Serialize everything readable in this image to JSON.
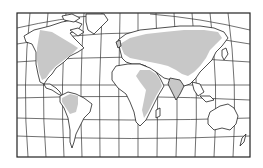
{
  "map": {
    "type": "world-map",
    "projection": "curved-graticule",
    "colors": {
      "background": "#ffffff",
      "land": "#ffffff",
      "shaded_region": "#c8c8c8",
      "outline": "#222222"
    },
    "shaded_regions": [
      "north-america",
      "northern-south-america",
      "europe",
      "northern-asia",
      "middle-east",
      "east-africa",
      "south-asia"
    ],
    "continents": [
      "north-america",
      "south-america",
      "europe",
      "africa",
      "asia",
      "australia",
      "greenland"
    ]
  }
}
